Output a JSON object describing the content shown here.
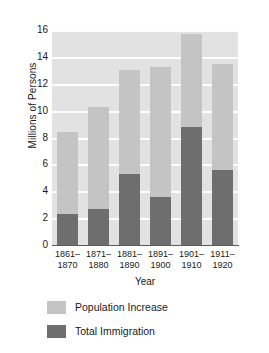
{
  "chart_data": {
    "type": "bar",
    "stacked": true,
    "title": "",
    "xlabel": "Year",
    "ylabel": "Millions of Persons",
    "categories": [
      "1861–1870",
      "1871–1880",
      "1881–1890",
      "1891–1900",
      "1901–1910",
      "1911–1920"
    ],
    "category_lines": [
      [
        "1861–",
        "1870"
      ],
      [
        "1871–",
        "1880"
      ],
      [
        "1881–",
        "1890"
      ],
      [
        "1891–",
        "1900"
      ],
      [
        "1901–",
        "1910"
      ],
      [
        "1911–",
        "1920"
      ]
    ],
    "series": [
      {
        "name": "Total Immigration",
        "color": "#6e6e6e",
        "values": [
          2.3,
          2.7,
          5.25,
          3.6,
          8.8,
          5.6
        ]
      },
      {
        "name": "Population Increase",
        "color": "#c4c4c4",
        "values": [
          8.4,
          10.3,
          13.0,
          13.25,
          15.7,
          13.5
        ],
        "note": "total bar height (stacked top of bar)"
      }
    ],
    "ylim": [
      0,
      16
    ],
    "yticks": [
      0,
      2,
      4,
      6,
      8,
      10,
      12,
      14,
      16
    ],
    "ytick_labels": [
      "0",
      "2",
      "4",
      "6",
      "8",
      "10",
      "12",
      "14",
      "16"
    ],
    "grid": true,
    "gridline_color": "#fdfdfd",
    "plot_background": "#e2e2e2",
    "legend_position": "bottom-left"
  },
  "legend": {
    "entries": [
      {
        "label": "Population Increase",
        "color": "#c4c4c4"
      },
      {
        "label": "Total Immigration",
        "color": "#6e6e6e"
      }
    ]
  }
}
